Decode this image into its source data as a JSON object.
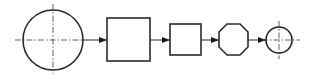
{
  "diagram": {
    "type": "process-flow",
    "colors": {
      "stroke": "#2a2a2a",
      "background": "#ffffff"
    },
    "nodes": [
      {
        "id": "large-circle",
        "shape": "circle",
        "cx": 53,
        "cy": 40,
        "r": 30,
        "centerlines": true
      },
      {
        "id": "large-square",
        "shape": "square",
        "x": 107,
        "y": 18,
        "w": 43,
        "h": 43
      },
      {
        "id": "small-square",
        "shape": "square",
        "x": 170,
        "y": 24,
        "w": 31,
        "h": 31
      },
      {
        "id": "octagon",
        "shape": "octagon",
        "x": 219,
        "y": 24,
        "w": 29,
        "h": 31
      },
      {
        "id": "small-circle",
        "shape": "circle",
        "cx": 279,
        "cy": 40,
        "r": 13,
        "centerlines": true
      }
    ],
    "edges": [
      {
        "from": "large-circle",
        "to": "large-square"
      },
      {
        "from": "large-square",
        "to": "small-square"
      },
      {
        "from": "small-square",
        "to": "octagon"
      },
      {
        "from": "octagon",
        "to": "small-circle"
      }
    ]
  }
}
